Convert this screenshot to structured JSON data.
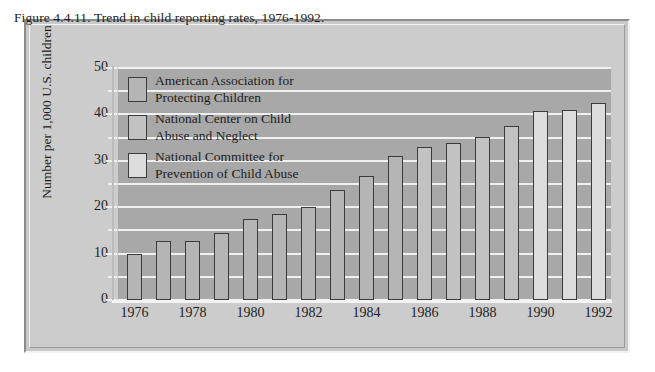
{
  "figure": {
    "title": "Figure 4.4.11. Trend in child reporting rates, 1976-1992.",
    "frame_color": "#c9c9c9",
    "plot_background": "#a8a8a8",
    "gridline_color": "#f0f0f0"
  },
  "legend": {
    "items": [
      {
        "label": "American Association for\nProtecting Children",
        "color": "#b5b5b5"
      },
      {
        "label": "National Center on Child\nAbuse and Neglect",
        "color": "#c2c2c2"
      },
      {
        "label": "National Committee for\nPrevention of Child Abuse",
        "color": "#dcdcdc"
      }
    ]
  },
  "chart_data": {
    "type": "bar",
    "title": "Figure 4.4.11. Trend in child reporting rates, 1976-1992.",
    "xlabel": "",
    "ylabel": "Number per 1,000 U.S. children",
    "ylim": [
      0,
      50
    ],
    "ytick_labels": [
      "0",
      "10",
      "20",
      "30",
      "40",
      "50"
    ],
    "ytick_values": [
      0,
      10,
      20,
      30,
      40,
      50
    ],
    "yminor_values": [
      5,
      15,
      25,
      35,
      45
    ],
    "grid": true,
    "legend_position": "upper-left-inside",
    "categories": [
      "1976",
      "1977",
      "1978",
      "1979",
      "1980",
      "1981",
      "1982",
      "1983",
      "1984",
      "1985",
      "1986",
      "1987",
      "1988",
      "1989",
      "1990",
      "1991",
      "1992"
    ],
    "xtick_labels": [
      "1976",
      "1978",
      "1980",
      "1982",
      "1984",
      "1986",
      "1988",
      "1990",
      "1992"
    ],
    "values": [
      9.9,
      12.8,
      12.8,
      14.5,
      17.4,
      18.6,
      20.1,
      23.8,
      26.8,
      31.0,
      32.9,
      33.8,
      35.1,
      37.6,
      40.8,
      40.9,
      42.5
    ],
    "series_assignment": [
      "American Association for Protecting Children",
      "American Association for Protecting Children",
      "American Association for Protecting Children",
      "American Association for Protecting Children",
      "American Association for Protecting Children",
      "American Association for Protecting Children",
      "American Association for Protecting Children",
      "American Association for Protecting Children",
      "American Association for Protecting Children",
      "American Association for Protecting Children",
      "National Center on Child Abuse and Neglect",
      "National Center on Child Abuse and Neglect",
      "National Center on Child Abuse and Neglect",
      "National Center on Child Abuse and Neglect",
      "National Committee for Prevention of Child Abuse",
      "National Committee for Prevention of Child Abuse",
      "National Committee for Prevention of Child Abuse"
    ],
    "bar_colors": [
      "#b5b5b5",
      "#b5b5b5",
      "#b5b5b5",
      "#b5b5b5",
      "#b5b5b5",
      "#b5b5b5",
      "#b5b5b5",
      "#b5b5b5",
      "#b5b5b5",
      "#b5b5b5",
      "#c2c2c2",
      "#c2c2c2",
      "#c2c2c2",
      "#c2c2c2",
      "#dcdcdc",
      "#dcdcdc",
      "#dcdcdc"
    ]
  }
}
